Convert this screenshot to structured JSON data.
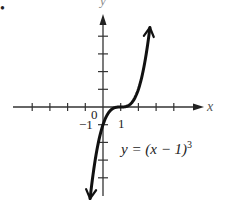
{
  "bullet": "•",
  "chart_data": {
    "type": "line",
    "title": "",
    "function": "y = (x − 1)^3",
    "xlabel": "x",
    "ylabel": "y",
    "xlim": [
      -5,
      4
    ],
    "ylim": [
      -5,
      5
    ],
    "x_ticks": [
      -4,
      -3,
      -2,
      -1,
      0,
      1,
      2,
      3,
      4
    ],
    "y_ticks": [
      -4,
      -3,
      -2,
      -1,
      0,
      1,
      2,
      3,
      4
    ],
    "tick_labels": {
      "origin": "0",
      "x_one": "1",
      "y_neg_one": "−1"
    },
    "grid": false,
    "series": [
      {
        "name": "y = (x − 1)^3",
        "x": [
          -0.73,
          -0.5,
          0,
          0.5,
          1,
          1.5,
          2,
          2.5,
          2.65
        ],
        "values": [
          -5.18,
          -3.38,
          -1,
          -0.125,
          0,
          0.125,
          1,
          3.38,
          4.49
        ]
      }
    ],
    "annotations": [
      {
        "text": "y = (x − 1)",
        "superscript": "3",
        "x": 1.4,
        "y": -2
      }
    ]
  },
  "labels": {
    "x_axis": "x",
    "y_axis": "y",
    "origin": "0",
    "x_one": "1",
    "y_neg_one": "−1",
    "equation_main": "y = (x − 1)",
    "equation_exp": "3"
  }
}
